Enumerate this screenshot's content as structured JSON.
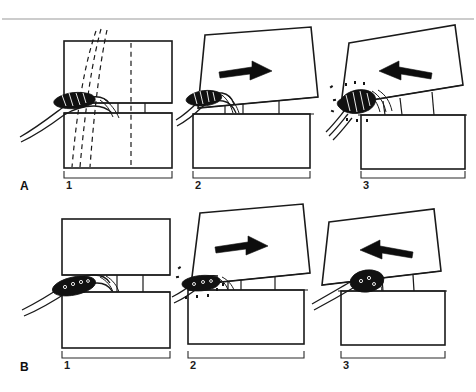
{
  "figure": {
    "background_color": "#ffffff",
    "ink_color": "#1a1a1a",
    "rule_color": "#9a9a9a",
    "arrow_color": "#0d0d0d",
    "root_color": "#111111"
  },
  "rows": [
    {
      "id": "A",
      "label": "A",
      "description": "Narrowed disc / foramen series",
      "panels": [
        {
          "number": "1",
          "state": "neutral",
          "arrow": "none",
          "arrow_label": "",
          "root_shape": "wedge",
          "root_state": "compressed-wedge",
          "has_dashed_lines": true,
          "dashed_line_count": 4
        },
        {
          "number": "2",
          "state": "tilted-open",
          "arrow": "right",
          "arrow_label": "flexion",
          "root_shape": "wedge",
          "root_state": "decompressed",
          "has_dashed_lines": false,
          "dashed_line_count": 0
        },
        {
          "number": "3",
          "state": "tilted-closed",
          "arrow": "left",
          "arrow_label": "extension",
          "root_shape": "wedge",
          "root_state": "pinched",
          "has_dashed_lines": false,
          "dashed_line_count": 0
        }
      ]
    },
    {
      "id": "B",
      "label": "B",
      "description": "Normal disc height / foramen series",
      "panels": [
        {
          "number": "1",
          "state": "neutral",
          "arrow": "none",
          "arrow_label": "",
          "root_shape": "oval",
          "root_state": "normal",
          "has_dashed_lines": false,
          "dashed_line_count": 0
        },
        {
          "number": "2",
          "state": "tilted-open",
          "arrow": "right",
          "arrow_label": "flexion",
          "root_shape": "flattened",
          "root_state": "pinched",
          "has_dashed_lines": false,
          "dashed_line_count": 0
        },
        {
          "number": "3",
          "state": "tilted-closed",
          "arrow": "left",
          "arrow_label": "extension",
          "root_shape": "round",
          "root_state": "normal",
          "has_dashed_lines": false,
          "dashed_line_count": 0
        }
      ]
    }
  ]
}
